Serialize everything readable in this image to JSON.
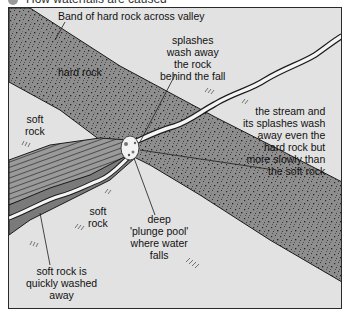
{
  "title": "How waterfalls are caused",
  "colors": {
    "background": "#e2e2e2",
    "hard_rock": "#8e8e8e",
    "hard_rock_speckle": "#2b2b2b",
    "gorge_rock": "#6f6f6f",
    "stream": "#f4f4f4",
    "outline": "#1a1a1a"
  },
  "labels": {
    "band": "Band of hard rock across valley",
    "hard_rock": "hard rock",
    "soft_rock_upper": [
      "soft",
      "rock"
    ],
    "soft_rock_lower": [
      "soft",
      "rock"
    ],
    "splashes": [
      "splashes",
      "wash away",
      "the rock",
      "behind the fall"
    ],
    "stream_wash": [
      "the stream and",
      "its splashes wash",
      "away even the",
      "hard rock but",
      "more slowly than",
      "the soft rock"
    ],
    "plunge_pool": [
      "deep",
      "'plunge pool'",
      "where water",
      "falls"
    ],
    "soft_washed": [
      "soft rock is",
      "quickly washed",
      "away"
    ]
  }
}
